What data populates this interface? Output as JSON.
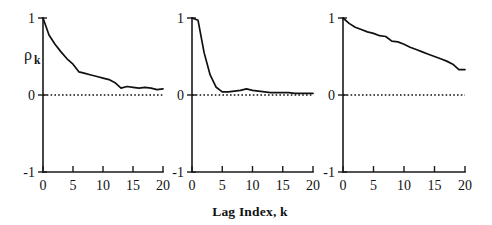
{
  "figure": {
    "background_color": "#ffffff",
    "line_color": "#111111",
    "xlabel": "Lag Index, k",
    "ylabel_symbol": "ρ",
    "ylabel_subscript": "k",
    "y_tick_labels": [
      "1",
      "0",
      "-1"
    ],
    "x_tick_labels": [
      "0",
      "5",
      "10",
      "15",
      "20"
    ]
  },
  "chart_data": [
    {
      "type": "line",
      "title": "",
      "panel": "left",
      "xlabel": "Lag Index, k",
      "ylabel": "ρk",
      "xlim": [
        0,
        20
      ],
      "ylim": [
        -1,
        1
      ],
      "xticks": [
        0,
        5,
        10,
        15,
        20
      ],
      "yticks": [
        -1,
        0,
        1
      ],
      "grid": false,
      "legend": "none",
      "annotations": [
        "zero reference line at ρk = 0 (dotted)"
      ],
      "x": [
        0,
        1,
        2,
        3,
        4,
        5,
        6,
        7,
        8,
        9,
        10,
        11,
        12,
        13,
        14,
        15,
        16,
        17,
        18,
        19,
        20
      ],
      "values": [
        1.0,
        0.78,
        0.66,
        0.56,
        0.47,
        0.4,
        0.3,
        0.28,
        0.26,
        0.24,
        0.22,
        0.2,
        0.16,
        0.09,
        0.11,
        0.1,
        0.09,
        0.1,
        0.09,
        0.07,
        0.08
      ]
    },
    {
      "type": "line",
      "title": "",
      "panel": "middle",
      "xlabel": "Lag Index, k",
      "ylabel": "ρk",
      "xlim": [
        0,
        20
      ],
      "ylim": [
        -1,
        1
      ],
      "xticks": [
        0,
        5,
        10,
        15,
        20
      ],
      "yticks": [
        -1,
        0,
        1
      ],
      "grid": false,
      "legend": "none",
      "annotations": [
        "zero reference line at ρk = 0 (dotted)"
      ],
      "x": [
        0,
        1,
        2,
        3,
        4,
        5,
        6,
        7,
        8,
        9,
        10,
        11,
        12,
        13,
        14,
        15,
        16,
        17,
        18,
        19,
        20
      ],
      "values": [
        1.0,
        0.97,
        0.55,
        0.26,
        0.1,
        0.04,
        0.04,
        0.05,
        0.06,
        0.08,
        0.06,
        0.05,
        0.04,
        0.03,
        0.03,
        0.03,
        0.03,
        0.02,
        0.02,
        0.02,
        0.02
      ]
    },
    {
      "type": "line",
      "title": "",
      "panel": "right",
      "xlabel": "Lag Index, k",
      "ylabel": "ρk",
      "xlim": [
        0,
        20
      ],
      "ylim": [
        -1,
        1
      ],
      "xticks": [
        0,
        5,
        10,
        15,
        20
      ],
      "yticks": [
        -1,
        0,
        1
      ],
      "grid": false,
      "legend": "none",
      "annotations": [
        "zero reference line at ρk = 0 (dotted)"
      ],
      "x": [
        0,
        1,
        2,
        3,
        4,
        5,
        6,
        7,
        8,
        9,
        10,
        11,
        12,
        13,
        14,
        15,
        16,
        17,
        18,
        19,
        20
      ],
      "values": [
        1.0,
        0.93,
        0.88,
        0.85,
        0.82,
        0.8,
        0.77,
        0.76,
        0.7,
        0.69,
        0.66,
        0.62,
        0.59,
        0.56,
        0.53,
        0.5,
        0.47,
        0.44,
        0.4,
        0.33,
        0.33
      ]
    }
  ]
}
